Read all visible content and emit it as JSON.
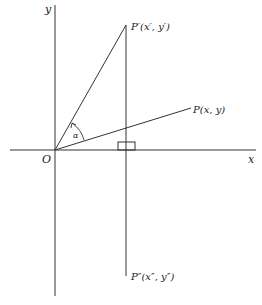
{
  "diagram": {
    "axes": {
      "x_label": "x",
      "y_label": "y",
      "origin_label": "O"
    },
    "points": {
      "p_prime": {
        "label": "P′(x′, y′)"
      },
      "p": {
        "label": "P(x, y)"
      },
      "p_double_prime": {
        "label": "P″(x″, y″)"
      }
    },
    "angle_label": "α",
    "colors": {
      "stroke": "#333333",
      "background": "#ffffff"
    }
  }
}
